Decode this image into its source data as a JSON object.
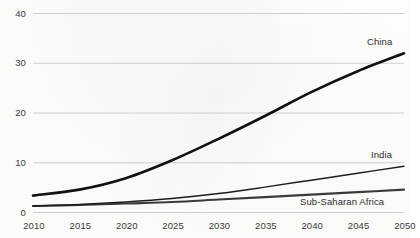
{
  "chart_data": {
    "type": "line",
    "title": "",
    "subtitle": "",
    "xlabel": "",
    "ylabel": "",
    "xlim": [
      2010,
      2050
    ],
    "ylim": [
      0,
      40
    ],
    "grid": true,
    "grid_axis": "y",
    "legend_position": "inline-end-of-line",
    "x": [
      2010,
      2015,
      2020,
      2025,
      2030,
      2035,
      2040,
      2045,
      2050
    ],
    "xticks": [
      "2010",
      "2015",
      "2020",
      "2025",
      "2030",
      "2035",
      "2040",
      "2045",
      "2050"
    ],
    "yticks": [
      "0",
      "10",
      "20",
      "30",
      "40"
    ],
    "ytick_values": [
      0,
      10,
      20,
      30,
      40
    ],
    "series": [
      {
        "name": "China",
        "label": "China",
        "color": "#111111",
        "width": 2.6,
        "values": [
          3.4,
          4.6,
          6.9,
          10.5,
          14.8,
          19.4,
          24.2,
          28.4,
          32.0
        ]
      },
      {
        "name": "India",
        "label": "India",
        "color": "#1d1d1d",
        "width": 1.5,
        "values": [
          1.3,
          1.6,
          2.1,
          2.8,
          3.8,
          5.1,
          6.5,
          7.9,
          9.3
        ]
      },
      {
        "name": "Sub-Saharan Africa",
        "label": "Sub-Saharan Africa",
        "color": "#3a3a3a",
        "width": 2.1,
        "values": [
          1.3,
          1.5,
          1.8,
          2.1,
          2.6,
          3.1,
          3.6,
          4.1,
          4.6
        ]
      }
    ]
  },
  "axes": {
    "y_tick_labels": [
      "40",
      "30",
      "20",
      "10",
      "0"
    ],
    "x_tick_labels": [
      "2010",
      "2015",
      "2020",
      "2025",
      "2030",
      "2035",
      "2040",
      "2045",
      "2050"
    ]
  },
  "labels": {
    "china": "China",
    "india": "India",
    "africa": "Sub-Saharan Africa"
  },
  "colors": {
    "background": "#fdfdfc",
    "gridline": "#c9c9c9",
    "axis_text": "#3b3b3b",
    "series_china": "#111111",
    "series_india": "#1d1d1d",
    "series_africa": "#3a3a3a"
  }
}
